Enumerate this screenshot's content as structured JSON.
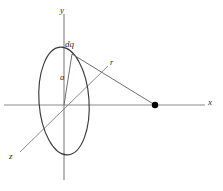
{
  "figure": {
    "background_color": "#ffffff",
    "axis_color": "#8a8a8a",
    "curve_color": "#3a3a3a",
    "line_color": "#6f6f6f",
    "point_color": "#000000",
    "text_color": "#2b2b2b"
  },
  "labels": {
    "y_axis": "y",
    "x_axis": "x",
    "z_axis": "z",
    "charge_element": "dq",
    "radius": "a",
    "distance": "r"
  },
  "geometry": {
    "origin": {
      "x": 64,
      "y": 105
    },
    "ring": {
      "center_x": 64,
      "center_y": 101,
      "radius_x": 25,
      "radius_y": 54,
      "rotation_deg": -4
    },
    "y_axis": {
      "x1": 64,
      "y1": 14,
      "x2": 64,
      "y2": 180
    },
    "x_axis": {
      "x1": 4,
      "y1": 105,
      "x2": 205,
      "y2": 105
    },
    "z_axis": {
      "x1": 20,
      "y1": 152,
      "x2": 108,
      "y2": 66
    },
    "charge_point": {
      "x": 72,
      "y": 54
    },
    "field_point": {
      "x": 155,
      "y": 105
    },
    "radius_line": {
      "x1": 64,
      "y1": 105,
      "x2": 72,
      "y2": 54
    },
    "distance_line": {
      "x1": 72,
      "y1": 54,
      "x2": 155,
      "y2": 105
    },
    "field_point_radius": 3.2
  },
  "label_positions": {
    "y_axis": {
      "left": 60,
      "top": 6
    },
    "x_axis": {
      "left": 208,
      "top": 98
    },
    "z_axis": {
      "left": 9,
      "top": 152
    },
    "charge_element": {
      "left": 65,
      "top": 40
    },
    "radius": {
      "left": 60,
      "top": 73
    },
    "distance": {
      "left": 110,
      "top": 58
    }
  }
}
